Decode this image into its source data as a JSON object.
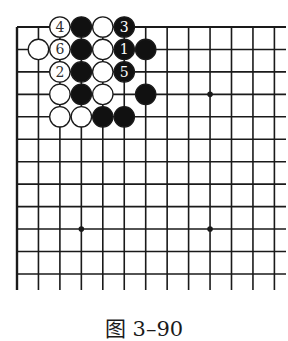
{
  "diagram": {
    "type": "go-board-partial",
    "caption": "图 3–90",
    "colors": {
      "line": "#1a1a1a",
      "black_stone": "#111111",
      "white_stone": "#ffffff",
      "white_label": "#333333",
      "black_label": "#ffffff"
    },
    "grid": {
      "origin_x": 17,
      "origin_y": 27,
      "dx": 21.45,
      "dy": 22.45,
      "cols": 13,
      "rows": 12,
      "extend_right_to": 286,
      "extend_bottom_to": 290,
      "edges": [
        "top",
        "left"
      ]
    },
    "star_points": [
      {
        "col": 9,
        "row": 3
      },
      {
        "col": 3,
        "row": 9
      },
      {
        "col": 9,
        "row": 9
      }
    ],
    "stones": [
      {
        "col": 2,
        "row": 0,
        "color": "white",
        "label": "4"
      },
      {
        "col": 3,
        "row": 0,
        "color": "black",
        "label": ""
      },
      {
        "col": 4,
        "row": 0,
        "color": "white",
        "label": ""
      },
      {
        "col": 5,
        "row": 0,
        "color": "black",
        "label": "3"
      },
      {
        "col": 1,
        "row": 1,
        "color": "white",
        "label": ""
      },
      {
        "col": 2,
        "row": 1,
        "color": "white",
        "label": "6"
      },
      {
        "col": 3,
        "row": 1,
        "color": "black",
        "label": ""
      },
      {
        "col": 4,
        "row": 1,
        "color": "white",
        "label": ""
      },
      {
        "col": 5,
        "row": 1,
        "color": "black",
        "label": "1"
      },
      {
        "col": 6,
        "row": 1,
        "color": "black",
        "label": ""
      },
      {
        "col": 2,
        "row": 2,
        "color": "white",
        "label": "2"
      },
      {
        "col": 3,
        "row": 2,
        "color": "black",
        "label": ""
      },
      {
        "col": 4,
        "row": 2,
        "color": "white",
        "label": ""
      },
      {
        "col": 5,
        "row": 2,
        "color": "black",
        "label": "5"
      },
      {
        "col": 2,
        "row": 3,
        "color": "white",
        "label": ""
      },
      {
        "col": 3,
        "row": 3,
        "color": "black",
        "label": ""
      },
      {
        "col": 4,
        "row": 3,
        "color": "white",
        "label": ""
      },
      {
        "col": 6,
        "row": 3,
        "color": "black",
        "label": ""
      },
      {
        "col": 2,
        "row": 4,
        "color": "white",
        "label": ""
      },
      {
        "col": 3,
        "row": 4,
        "color": "white",
        "label": ""
      },
      {
        "col": 4,
        "row": 4,
        "color": "black",
        "label": ""
      },
      {
        "col": 5,
        "row": 4,
        "color": "black",
        "label": ""
      }
    ]
  }
}
